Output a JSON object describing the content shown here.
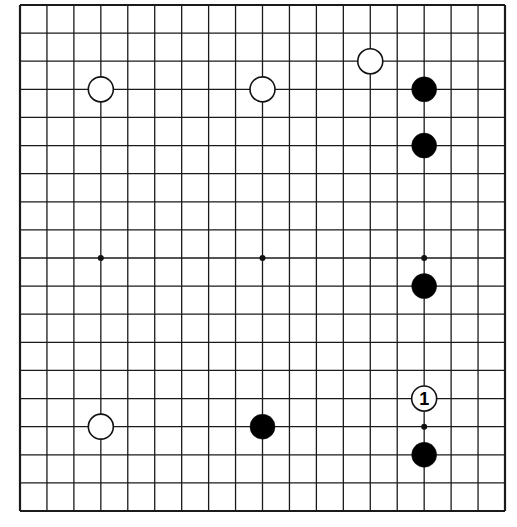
{
  "board": {
    "size": 19,
    "left": 20,
    "top": 5,
    "right": 505,
    "bottom": 511,
    "line_color": "#1a1a1a",
    "background": "#ffffff"
  },
  "star_points": [
    [
      3,
      3
    ],
    [
      9,
      3
    ],
    [
      15,
      3
    ],
    [
      3,
      9
    ],
    [
      9,
      9
    ],
    [
      15,
      9
    ],
    [
      3,
      15
    ],
    [
      9,
      15
    ],
    [
      15,
      15
    ]
  ],
  "stones": [
    {
      "color": "white",
      "col": 3,
      "row": 3
    },
    {
      "color": "white",
      "col": 9,
      "row": 3
    },
    {
      "color": "white",
      "col": 13,
      "row": 2
    },
    {
      "color": "white",
      "col": 3,
      "row": 15
    },
    {
      "color": "black",
      "col": 15,
      "row": 3
    },
    {
      "color": "black",
      "col": 15,
      "row": 5
    },
    {
      "color": "black",
      "col": 15,
      "row": 10
    },
    {
      "color": "black",
      "col": 9,
      "row": 15
    },
    {
      "color": "black",
      "col": 15,
      "row": 16
    },
    {
      "color": "white",
      "col": 15,
      "row": 14,
      "label": "1"
    }
  ]
}
